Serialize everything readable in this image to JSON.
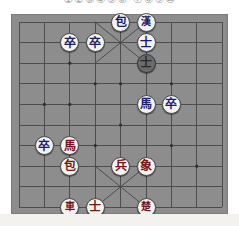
{
  "header": {
    "caption": "①②③④⑤⑥ ⑦⑧⑨⑩"
  },
  "footer": {
    "caption": ""
  },
  "board": {
    "name": "janggi-board",
    "files": 9,
    "ranks": 10,
    "background_color": "#8d8d8d",
    "line_color": "#4d4d4d",
    "border_color": "#7d7d7d",
    "palace_note": "diagonals drawn in top palace and bottom palace"
  },
  "pieces": [
    {
      "id": "p1",
      "label": "包",
      "file": 4,
      "rank": 0,
      "side": "blue",
      "style": "light",
      "name": "piece-cannon-blue"
    },
    {
      "id": "p2",
      "label": "漢",
      "file": 5,
      "rank": 0,
      "side": "blue",
      "style": "light",
      "name": "piece-general-han"
    },
    {
      "id": "p3",
      "label": "士",
      "file": 5,
      "rank": 1,
      "side": "blue",
      "style": "light",
      "name": "piece-advisor-blue-1"
    },
    {
      "id": "p4",
      "label": "士",
      "file": 5,
      "rank": 2,
      "side": "blue",
      "style": "dark",
      "name": "piece-advisor-blue-2-selected"
    },
    {
      "id": "p5",
      "label": "卒",
      "file": 2,
      "rank": 1,
      "side": "blue",
      "style": "light",
      "name": "piece-pawn-blue-1"
    },
    {
      "id": "p6",
      "label": "卒",
      "file": 3,
      "rank": 1,
      "side": "blue",
      "style": "light",
      "name": "piece-pawn-blue-2"
    },
    {
      "id": "p7",
      "label": "馬",
      "file": 5,
      "rank": 4,
      "side": "blue",
      "style": "light",
      "name": "piece-horse-blue"
    },
    {
      "id": "p8",
      "label": "卒",
      "file": 6,
      "rank": 4,
      "side": "blue",
      "style": "light",
      "name": "piece-pawn-blue-3"
    },
    {
      "id": "p9",
      "label": "卒",
      "file": 1,
      "rank": 6,
      "side": "blue",
      "style": "light",
      "name": "piece-pawn-blue-4"
    },
    {
      "id": "p10",
      "label": "馬",
      "file": 2,
      "rank": 6,
      "side": "red",
      "style": "light",
      "name": "piece-horse-red"
    },
    {
      "id": "p11",
      "label": "包",
      "file": 2,
      "rank": 7,
      "side": "red",
      "style": "light",
      "name": "piece-cannon-red"
    },
    {
      "id": "p12",
      "label": "兵",
      "file": 4,
      "rank": 7,
      "side": "red",
      "style": "light",
      "name": "piece-soldier-red"
    },
    {
      "id": "p13",
      "label": "象",
      "file": 5,
      "rank": 7,
      "side": "red",
      "style": "light",
      "name": "piece-elephant-red"
    },
    {
      "id": "p14",
      "label": "車",
      "file": 2,
      "rank": 9,
      "side": "red",
      "style": "light",
      "name": "piece-chariot-red"
    },
    {
      "id": "p15",
      "label": "士",
      "file": 3,
      "rank": 9,
      "side": "red",
      "style": "light",
      "name": "piece-advisor-red"
    },
    {
      "id": "p16",
      "label": "楚",
      "file": 5,
      "rank": 9,
      "side": "red",
      "style": "light",
      "name": "piece-general-chu"
    }
  ]
}
